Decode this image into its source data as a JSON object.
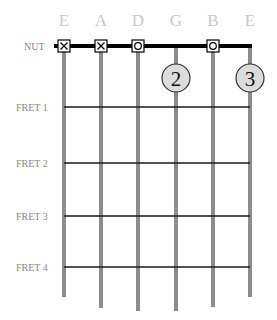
{
  "diagram": {
    "strings": [
      {
        "name": "E",
        "x": 64,
        "bottom": 297,
        "nut_marker": "X"
      },
      {
        "name": "A",
        "x": 101,
        "bottom": 308,
        "nut_marker": "X"
      },
      {
        "name": "D",
        "x": 138,
        "bottom": 311,
        "nut_marker": "O"
      },
      {
        "name": "G",
        "x": 176,
        "bottom": 311,
        "nut_marker": null
      },
      {
        "name": "B",
        "x": 213,
        "bottom": 307,
        "nut_marker": "O"
      },
      {
        "name": "E",
        "x": 250,
        "bottom": 297,
        "nut_marker": null
      }
    ],
    "nut": {
      "label": "NUT",
      "y": 46
    },
    "frets": [
      {
        "label": "FRET 1",
        "y": 107
      },
      {
        "label": "FRET 2",
        "y": 163
      },
      {
        "label": "FRET 3",
        "y": 216
      },
      {
        "label": "FRET 4",
        "y": 267
      }
    ],
    "fingers": [
      {
        "string_index": 3,
        "string": "G",
        "fret_between": "nut-fret1",
        "finger": "2",
        "cx": 176,
        "cy": 78
      },
      {
        "string_index": 5,
        "string": "E",
        "fret_between": "nut-fret1",
        "finger": "3",
        "cx": 250,
        "cy": 78
      }
    ],
    "colors": {
      "string": "#8c8c8c",
      "fret": "#1a1a1a",
      "nut": "#000000",
      "label": "#888888",
      "string_name": "#c8c8c8",
      "finger_fill": "#dcdcdc",
      "finger_stroke": "#333333"
    }
  }
}
